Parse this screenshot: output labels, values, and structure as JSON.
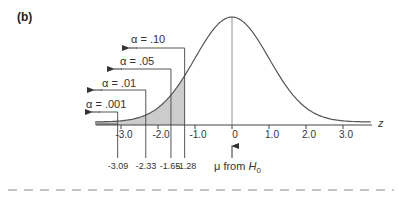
{
  "panel_label": "(b)",
  "axis": {
    "variable": "z",
    "ticks": [
      "-3.0",
      "-2.0",
      "-1.0",
      "0",
      "1.0",
      "2.0",
      "3.0"
    ],
    "tick_values": [
      -3,
      -2,
      -1,
      0,
      1,
      2,
      3
    ]
  },
  "alphas": [
    {
      "label": "α = .10",
      "critical": "-1.28"
    },
    {
      "label": "α = .05",
      "critical": "-1.65"
    },
    {
      "label": "α = .01",
      "critical": "-2.33"
    },
    {
      "label": "α = .001",
      "critical": "-3.09"
    }
  ],
  "mean_label": {
    "prefix": "μ from ",
    "var": "H",
    "sub": "0"
  },
  "colors": {
    "curve": "#555555",
    "shade": "#cccccc",
    "line": "#444444",
    "dash": "#888888"
  },
  "chart_data": {
    "type": "area",
    "title": "(b)",
    "xlabel": "z",
    "ylabel": "",
    "x_ticks": [
      -3.0,
      -2.0,
      -1.0,
      0,
      1.0,
      2.0,
      3.0
    ],
    "curve": "standard normal density",
    "shaded_region": "z < -1.28 (left tail)",
    "critical_values": [
      {
        "alpha": 0.1,
        "z": -1.28
      },
      {
        "alpha": 0.05,
        "z": -1.65
      },
      {
        "alpha": 0.01,
        "z": -2.33
      },
      {
        "alpha": 0.001,
        "z": -3.09
      }
    ],
    "annotations": [
      "μ from H0 at z = 0"
    ],
    "grid": false
  }
}
